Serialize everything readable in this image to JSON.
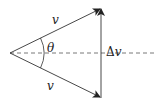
{
  "diagram": {
    "labels": {
      "top_vector": "v",
      "bottom_vector": "v",
      "angle": "θ",
      "delta_prefix": "Δ",
      "delta_var": "v"
    },
    "geometry": {
      "origin": [
        10,
        53
      ],
      "top_tip": [
        101,
        8
      ],
      "bottom_tip": [
        101,
        98
      ],
      "dashed_line_y": 53
    },
    "colors": {
      "stroke": "#333333",
      "dashed": "#555555"
    }
  }
}
